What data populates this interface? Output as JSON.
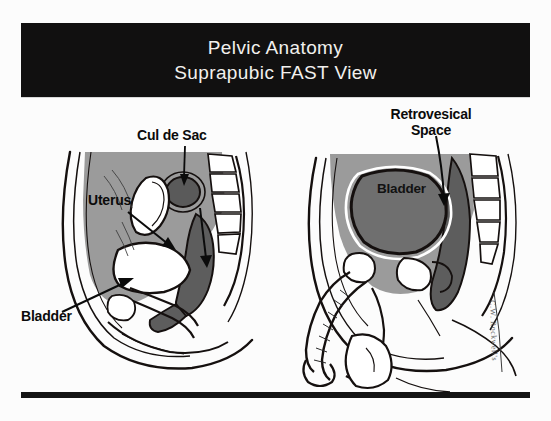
{
  "slide": {
    "title": {
      "line1": "Pelvic Anatomy",
      "line2": "Suprapubic FAST View"
    },
    "background_color": "#fcfcfc",
    "banner_color": "#111010",
    "banner_text_color": "#f2f0ee"
  },
  "figures": {
    "left": {
      "name": "female-pelvis-sagittal",
      "labels": {
        "cul_de_sac": "Cul de Sac",
        "uterus": "Uterus",
        "bladder": "Bladder"
      }
    },
    "right": {
      "name": "male-pelvis-sagittal",
      "labels": {
        "retrovesical_space_line1": "Retrovesical",
        "retrovesical_space_line2": "Space",
        "bladder": "Bladder"
      }
    }
  },
  "credit": {
    "signature": "C.W. Rockwell's"
  },
  "colors": {
    "ink": "#0b0b0b",
    "soft_tissue_gray": "#9a9a9a",
    "organ_dark_gray": "#5d5d5d",
    "bladder_fill": "#6f6f6f",
    "white": "#ffffff",
    "rule": "#141414"
  }
}
